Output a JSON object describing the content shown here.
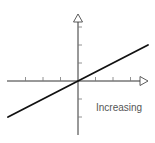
{
  "diagram": {
    "title": "",
    "label": "Increasing",
    "colors": {
      "axis": "#333333",
      "line": "#111111",
      "label": "#555555",
      "background": "#ffffff"
    }
  },
  "chart_data": {
    "type": "line",
    "title": "",
    "xlabel": "",
    "ylabel": "",
    "xlim": [
      -4,
      4
    ],
    "ylim": [
      -3,
      4
    ],
    "x_ticks": [
      -3,
      -2,
      -1,
      1,
      2,
      3
    ],
    "y_ticks": [
      -2,
      -1,
      1,
      2,
      3
    ],
    "grid": false,
    "series": [
      {
        "name": "Increasing",
        "x": [
          -4,
          4
        ],
        "y": [
          -2,
          2
        ]
      }
    ],
    "annotations": [
      {
        "text": "Increasing",
        "position": "lower-right"
      }
    ]
  }
}
